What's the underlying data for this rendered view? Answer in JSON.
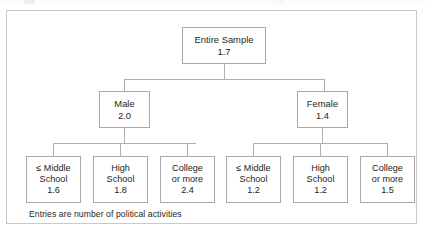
{
  "figure": {
    "note": "Entries are number of political activities",
    "frame_color": "#c9c9c9",
    "box_border_color": "#a9a9a9",
    "connector_color": "#b0b0b0",
    "text_color": "#231f20",
    "background": "#ffffff"
  },
  "chart_data": {
    "type": "diagram",
    "subtype": "tree",
    "title": "",
    "note": "Entries are number of political activities",
    "value_label": "number of political activities",
    "root": {
      "label": "Entire Sample",
      "value": "1.7"
    },
    "level2": [
      {
        "label": "Male",
        "value": "2.0"
      },
      {
        "label": "Female",
        "value": "1.4"
      }
    ],
    "level3": [
      {
        "parent": "Male",
        "label_line1": "≤ Middle",
        "label_line2": "School",
        "value": "1.6"
      },
      {
        "parent": "Male",
        "label_line1": "High",
        "label_line2": "School",
        "value": "1.8"
      },
      {
        "parent": "Male",
        "label_line1": "College",
        "label_line2": "or more",
        "value": "2.4"
      },
      {
        "parent": "Female",
        "label_line1": "≤ Middle",
        "label_line2": "School",
        "value": "1.2"
      },
      {
        "parent": "Female",
        "label_line1": "High",
        "label_line2": "School",
        "value": "1.2"
      },
      {
        "parent": "Female",
        "label_line1": "College",
        "label_line2": "or more",
        "value": "1.5"
      }
    ]
  }
}
